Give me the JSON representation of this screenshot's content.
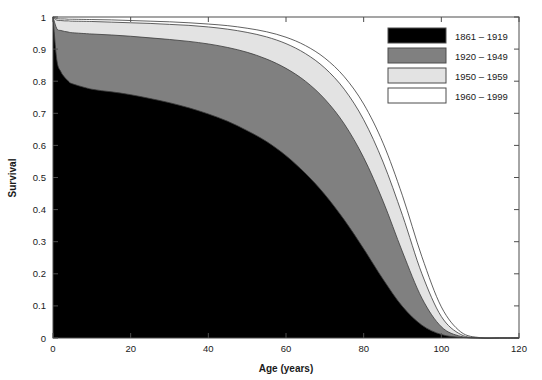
{
  "chart_data": {
    "type": "area",
    "title": "",
    "xlabel": "Age (years)",
    "ylabel": "Survival",
    "xlim": [
      0,
      120
    ],
    "ylim": [
      0,
      1
    ],
    "xticks": [
      0,
      20,
      40,
      60,
      80,
      100,
      120
    ],
    "yticks": [
      0,
      0.1,
      0.2,
      0.3,
      0.4,
      0.5,
      0.6,
      0.7,
      0.8,
      0.9,
      1
    ],
    "xtick_labels": [
      "0",
      "20",
      "40",
      "60",
      "80",
      "100",
      "120"
    ],
    "ytick_labels": [
      "0",
      "0.1",
      "0.2",
      "0.3",
      "0.4",
      "0.5",
      "0.6",
      "0.7",
      "0.8",
      "0.9",
      "1"
    ],
    "grid": false,
    "legend_position": "top-right",
    "stacking": "overlaid-bands",
    "x": [
      0,
      1,
      2,
      3,
      4,
      5,
      10,
      15,
      20,
      25,
      30,
      35,
      40,
      45,
      50,
      55,
      60,
      65,
      70,
      75,
      80,
      85,
      90,
      95,
      100,
      105,
      110,
      115,
      120
    ],
    "series": [
      {
        "name": "1861 – 1919",
        "color": "#000000",
        "values": [
          1.0,
          0.865,
          0.83,
          0.812,
          0.8,
          0.792,
          0.775,
          0.767,
          0.758,
          0.746,
          0.733,
          0.717,
          0.698,
          0.675,
          0.646,
          0.612,
          0.568,
          0.513,
          0.447,
          0.368,
          0.278,
          0.183,
          0.098,
          0.04,
          0.011,
          0.002,
          0.0,
          0.0,
          0.0
        ]
      },
      {
        "name": "1920 – 1949",
        "color": "#808080",
        "values": [
          1.0,
          0.963,
          0.958,
          0.955,
          0.953,
          0.951,
          0.947,
          0.944,
          0.94,
          0.935,
          0.93,
          0.924,
          0.916,
          0.905,
          0.89,
          0.869,
          0.84,
          0.8,
          0.744,
          0.667,
          0.562,
          0.426,
          0.268,
          0.124,
          0.035,
          0.005,
          0.0,
          0.0,
          0.0
        ]
      },
      {
        "name": "1950 – 1959",
        "color": "#e3e3e3",
        "values": [
          1.0,
          0.99,
          0.989,
          0.988,
          0.988,
          0.987,
          0.986,
          0.984,
          0.982,
          0.98,
          0.977,
          0.974,
          0.969,
          0.962,
          0.952,
          0.938,
          0.917,
          0.886,
          0.841,
          0.775,
          0.68,
          0.548,
          0.382,
          0.2,
          0.067,
          0.011,
          0.0,
          0.0,
          0.0
        ]
      },
      {
        "name": "1960 – 1999",
        "color": "#ffffff",
        "values": [
          1.0,
          0.995,
          0.994,
          0.994,
          0.993,
          0.993,
          0.992,
          0.991,
          0.989,
          0.987,
          0.985,
          0.982,
          0.978,
          0.973,
          0.965,
          0.954,
          0.937,
          0.911,
          0.872,
          0.814,
          0.729,
          0.607,
          0.443,
          0.253,
          0.097,
          0.019,
          0.001,
          0.0,
          0.0
        ]
      }
    ]
  },
  "legend": {
    "entries": [
      {
        "label": "1861 – 1919",
        "swatch": "#000000"
      },
      {
        "label": "1920 – 1949",
        "swatch": "#808080"
      },
      {
        "label": "1950 – 1959",
        "swatch": "#e3e3e3"
      },
      {
        "label": "1960 – 1999",
        "swatch": "#ffffff"
      }
    ]
  },
  "axes": {
    "x_title": "Age (years)",
    "y_title": "Survival"
  }
}
